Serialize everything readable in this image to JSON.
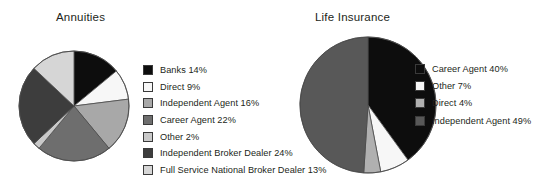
{
  "background_color": "#ffffff",
  "text_color": "#231f20",
  "charts": [
    {
      "id": "annuities",
      "title": "Annuities",
      "legend": [
        {
          "label": "Banks 14%",
          "name": "Banks",
          "value": 14,
          "color": "#0d0d0d"
        },
        {
          "label": "Direct 9%",
          "name": "Direct",
          "value": 9,
          "color": "#f7f7f7"
        },
        {
          "label": "Independent Agent 16%",
          "name": "Independent Agent",
          "value": 16,
          "color": "#a8a8a8"
        },
        {
          "label": "Career Agent 22%",
          "name": "Career Agent",
          "value": 22,
          "color": "#6e6e6e"
        },
        {
          "label": "Other 2%",
          "name": "Other",
          "value": 2,
          "color": "#c9c9c9"
        },
        {
          "label": "Independent Broker Dealer 24%",
          "name": "Independent Broker Dealer",
          "value": 24,
          "color": "#3d3d3d"
        },
        {
          "label": "Full Service National Broker Dealer 13%",
          "name": "Full Service National Broker Dealer",
          "value": 13,
          "color": "#d6d6d6"
        }
      ]
    },
    {
      "id": "life",
      "title": "Life Insurance",
      "legend": [
        {
          "label": "Career Agent 40%",
          "name": "Career Agent",
          "value": 40,
          "color": "#0d0d0d"
        },
        {
          "label": "Other 7%",
          "name": "Other",
          "value": 7,
          "color": "#f7f7f7"
        },
        {
          "label": "Direct 4%",
          "name": "Direct",
          "value": 4,
          "color": "#b0b0b0"
        },
        {
          "label": "Independent Agent 49%",
          "name": "Independent Agent",
          "value": 49,
          "color": "#585858"
        }
      ]
    }
  ],
  "chart_data": [
    {
      "type": "pie",
      "title": "Annuities",
      "labels": [
        "Banks",
        "Direct",
        "Independent Agent",
        "Career Agent",
        "Other",
        "Independent Broker Dealer",
        "Full Service National Broker Dealer"
      ],
      "values": [
        14,
        9,
        16,
        22,
        2,
        24,
        13
      ],
      "units": "percent",
      "total": 100,
      "colors": [
        "#0d0d0d",
        "#f7f7f7",
        "#a8a8a8",
        "#6e6e6e",
        "#c9c9c9",
        "#3d3d3d",
        "#d6d6d6"
      ],
      "legend_position": "right",
      "start_angle_deg": 0,
      "direction": "clockwise",
      "data_labels": false,
      "grid": false
    },
    {
      "type": "pie",
      "title": "Life Insurance",
      "labels": [
        "Career Agent",
        "Other",
        "Direct",
        "Independent Agent"
      ],
      "values": [
        40,
        7,
        4,
        49
      ],
      "units": "percent",
      "total": 100,
      "colors": [
        "#0d0d0d",
        "#f7f7f7",
        "#b0b0b0",
        "#585858"
      ],
      "legend_position": "right",
      "start_angle_deg": 0,
      "direction": "clockwise",
      "data_labels": false,
      "grid": false
    }
  ],
  "pie_geometry": {
    "annuities": {
      "radius": 55,
      "stroke": "#4a4a4a",
      "stroke_width": 0.8
    },
    "life": {
      "radius": 68,
      "stroke": "#4a4a4a",
      "stroke_width": 0.8
    }
  }
}
